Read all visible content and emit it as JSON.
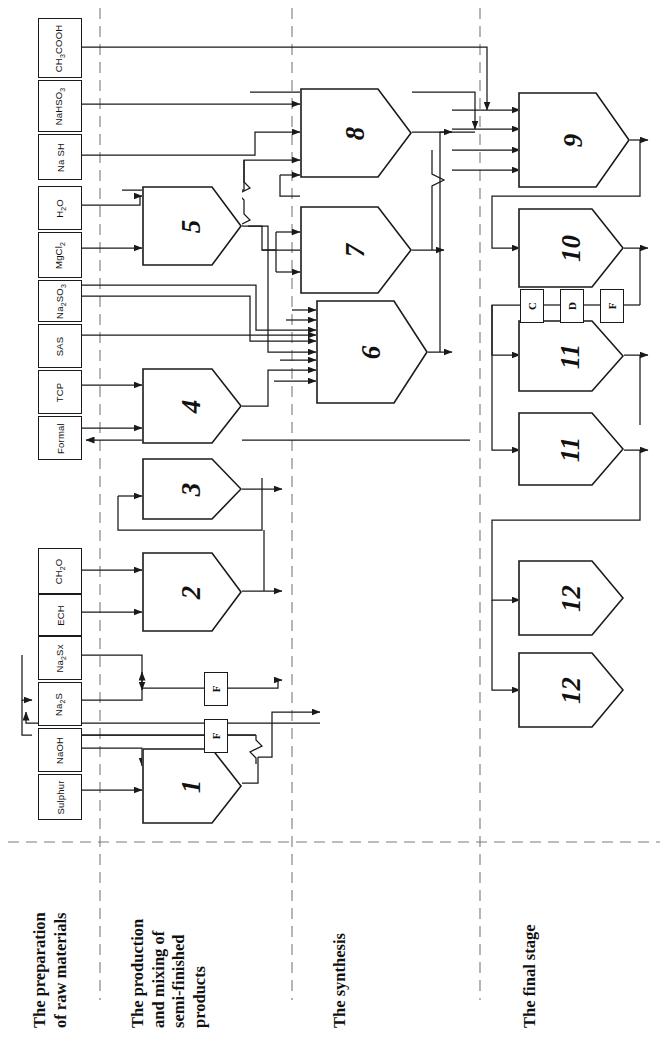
{
  "figure": {
    "orientation": "rotated-90",
    "background": "#ffffff",
    "line_color": "#1a1a1a",
    "divider_color": "#7a7a7a"
  },
  "stages": [
    {
      "id": "stage-1",
      "label": "The preparation\nof raw materials"
    },
    {
      "id": "stage-2",
      "label": "The production\nand mixing of\nsemi-finished\nproducts"
    },
    {
      "id": "stage-3",
      "label": "The synthesis"
    },
    {
      "id": "stage-4",
      "label": "The final stage"
    }
  ],
  "reagents": [
    {
      "id": "r-ch3cooh",
      "label": "CH3COOH"
    },
    {
      "id": "r-nahso3",
      "label": "NaHSO3"
    },
    {
      "id": "r-nash",
      "label": "Na SH"
    },
    {
      "id": "r-h2o",
      "label": "H2O"
    },
    {
      "id": "r-mgcl2",
      "label": "MgCl2"
    },
    {
      "id": "r-na2so3",
      "label": "Na2SO3"
    },
    {
      "id": "r-sas",
      "label": "SAS"
    },
    {
      "id": "r-tcp",
      "label": "TCP"
    },
    {
      "id": "r-formal",
      "label": "Formal"
    },
    {
      "id": "r-ch2o",
      "label": "CH2O"
    },
    {
      "id": "r-ech",
      "label": "ECH"
    },
    {
      "id": "r-na2sx",
      "label": "Na2Sx"
    },
    {
      "id": "r-na2s",
      "label": "Na2S"
    },
    {
      "id": "r-naoh",
      "label": "NaOH"
    },
    {
      "id": "r-sulphur",
      "label": "Sulphur"
    }
  ],
  "process_units": [
    {
      "id": "unit-1",
      "label": "1",
      "stage": "stage-2"
    },
    {
      "id": "unit-2",
      "label": "2",
      "stage": "stage-2"
    },
    {
      "id": "unit-3",
      "label": "3",
      "stage": "stage-2"
    },
    {
      "id": "unit-4",
      "label": "4",
      "stage": "stage-2"
    },
    {
      "id": "unit-5",
      "label": "5",
      "stage": "stage-2"
    },
    {
      "id": "unit-6",
      "label": "6",
      "stage": "stage-3"
    },
    {
      "id": "unit-7",
      "label": "7",
      "stage": "stage-3"
    },
    {
      "id": "unit-8",
      "label": "8",
      "stage": "stage-3"
    },
    {
      "id": "unit-9",
      "label": "9",
      "stage": "stage-4"
    },
    {
      "id": "unit-10",
      "label": "10",
      "stage": "stage-4"
    },
    {
      "id": "unit-11a",
      "label": "11",
      "stage": "stage-4"
    },
    {
      "id": "unit-11b",
      "label": "11",
      "stage": "stage-4"
    },
    {
      "id": "unit-12a",
      "label": "12",
      "stage": "stage-4"
    },
    {
      "id": "unit-12b",
      "label": "12",
      "stage": "stage-4"
    }
  ],
  "markers": [
    {
      "id": "marker-f1",
      "label": "F"
    },
    {
      "id": "marker-f2",
      "label": "F"
    },
    {
      "id": "marker-c",
      "label": "C"
    },
    {
      "id": "marker-d",
      "label": "D"
    },
    {
      "id": "marker-f3",
      "label": "F"
    }
  ]
}
